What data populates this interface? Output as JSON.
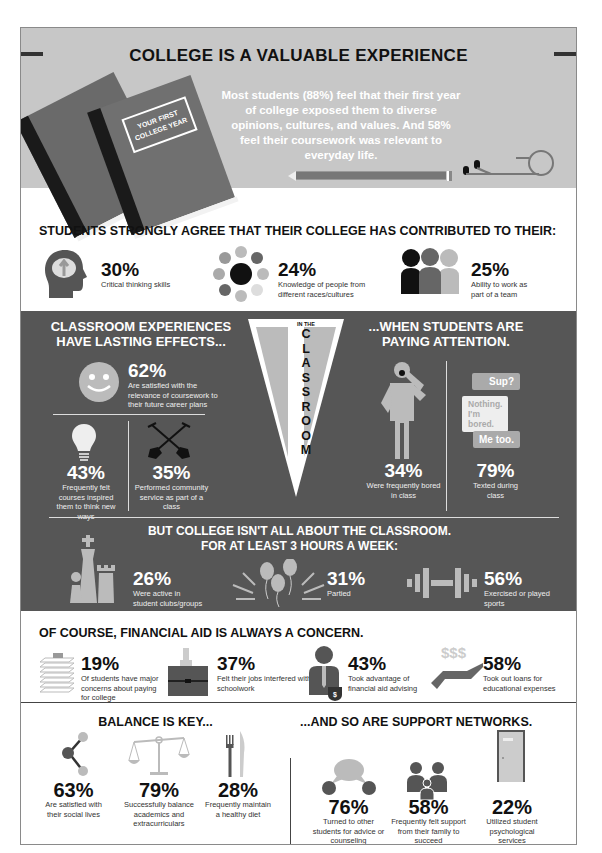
{
  "hero": {
    "title": "COLLEGE IS A VALUABLE EXPERIENCE",
    "text": "Most students (88%) feel that their first year of college exposed them to diverse opinions, cultures, and values. And 58% feel their coursework was relevant to everyday life.",
    "book_label_line1": "YOUR FIRST",
    "book_label_line2": "COLLEGE YEAR"
  },
  "contributed": {
    "title": "STUDENTS STRONGLY AGREE THAT THEIR COLLEGE HAS CONTRIBUTED TO THEIR:",
    "items": [
      {
        "pct": "30%",
        "desc": "Critical thinking skills",
        "icon": "brain-head-icon"
      },
      {
        "pct": "24%",
        "desc": "Knowledge of people from different races/cultures",
        "icon": "circles-diversity-icon"
      },
      {
        "pct": "25%",
        "desc": "Ability to work as part of a team",
        "icon": "team-people-icon"
      }
    ]
  },
  "classroom": {
    "left_title": "CLASSROOM EXPERIENCES HAVE LASTING EFFECTS...",
    "right_title": "...WHEN STUDENTS ARE PAYING ATTENTION.",
    "pennant_small": "IN THE",
    "pennant_letters": [
      "C",
      "L",
      "A",
      "S",
      "S",
      "R",
      "O",
      "O",
      "M"
    ],
    "items": [
      {
        "pct": "62%",
        "desc": "Are satisfied with the relevance of coursework to their future career plans",
        "icon": "smiley-face-icon"
      },
      {
        "pct": "43%",
        "desc": "Frequently felt courses inspired them to think new ways",
        "icon": "lightbulb-icon"
      },
      {
        "pct": "35%",
        "desc": "Performed community service as part of a class",
        "icon": "crossed-shovels-icon"
      },
      {
        "pct": "34%",
        "desc": "Were frequently bored in class",
        "icon": "yawning-person-icon"
      },
      {
        "pct": "79%",
        "desc": "Texted during class",
        "icon": "text-messages-icon"
      }
    ],
    "messages": [
      "Sup?",
      "Nothing. I'm bored.",
      "Me too."
    ]
  },
  "outside": {
    "title_line1": "BUT COLLEGE ISN'T ALL ABOUT THE CLASSROOM.",
    "title_line2": "FOR AT LEAST 3 HOURS A WEEK:",
    "items": [
      {
        "pct": "26%",
        "desc": "Were active in student clubs/groups",
        "icon": "chess-pieces-icon"
      },
      {
        "pct": "31%",
        "desc": "Partied",
        "icon": "balloons-icon"
      },
      {
        "pct": "56%",
        "desc": "Exercised or played sports",
        "icon": "dumbbell-icon"
      }
    ]
  },
  "financial": {
    "title": "OF COURSE, FINANCIAL AID IS ALWAYS A CONCERN.",
    "items": [
      {
        "pct": "19%",
        "desc": "Of students have major concerns about paying for college",
        "icon": "paper-stack-icon"
      },
      {
        "pct": "37%",
        "desc": "Felt their jobs interfered with schoolwork",
        "icon": "briefcase-icon"
      },
      {
        "pct": "43%",
        "desc": "Took advantage of financial aid advising",
        "icon": "advisor-shield-icon"
      },
      {
        "pct": "58%",
        "desc": "Took out loans for educational expenses",
        "icon": "hand-money-icon"
      }
    ],
    "money_symbol": "$$$"
  },
  "balance": {
    "title": "BALANCE IS KEY...",
    "items": [
      {
        "pct": "63%",
        "desc": "Are satisfied with their social lives",
        "icon": "social-network-icon"
      },
      {
        "pct": "79%",
        "desc": "Successfully balance academics and extracurriculars",
        "icon": "scale-icon"
      },
      {
        "pct": "28%",
        "desc": "Frequently maintain a healthy diet",
        "icon": "fork-knife-icon"
      }
    ]
  },
  "support": {
    "title": "...AND SO ARE SUPPORT NETWORKS.",
    "items": [
      {
        "pct": "76%",
        "desc": "Turned to other students for advice or counseling",
        "icon": "conversation-icon"
      },
      {
        "pct": "58%",
        "desc": "Frequently felt support from their family to succeed",
        "icon": "family-icon"
      },
      {
        "pct": "22%",
        "desc": "Utilized student psychological services",
        "icon": "door-icon"
      }
    ]
  },
  "colors": {
    "hero_bg": "#c7c7c7",
    "dark_bg": "#565656",
    "light_gray": "#bdbdbd",
    "text_dark": "#111111"
  }
}
